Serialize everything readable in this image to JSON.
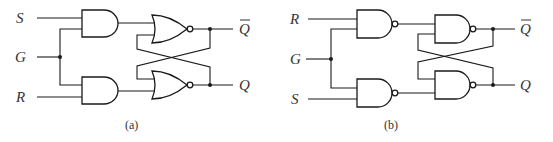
{
  "diagrams": [
    {
      "id": "a",
      "caption": "(a)",
      "gate_type": "NOR",
      "input_gate_type": "AND",
      "inputs": {
        "top": "S",
        "middle": "G",
        "bottom": "R"
      },
      "outputs": {
        "top": "Q̄",
        "bottom": "Q"
      }
    },
    {
      "id": "b",
      "caption": "(b)",
      "gate_type": "NAND",
      "input_gate_type": "NAND",
      "inputs": {
        "top": "R",
        "middle": "G",
        "bottom": "S"
      },
      "outputs": {
        "top": "Q̄",
        "bottom": "Q"
      }
    }
  ],
  "colors": {
    "stroke": "#1a1a1a",
    "text": "#333333",
    "background": "#ffffff"
  }
}
